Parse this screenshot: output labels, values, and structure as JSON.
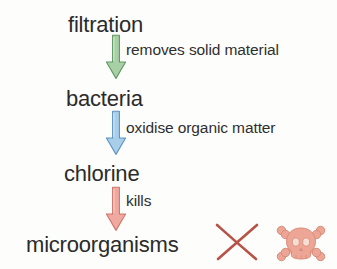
{
  "diagram": {
    "background_color": "#fdfdfc",
    "text_color": "#2b2b2b",
    "nodes": [
      {
        "id": "filtration",
        "label": "filtration"
      },
      {
        "id": "bacteria",
        "label": "bacteria"
      },
      {
        "id": "chlorine",
        "label": "chlorine"
      },
      {
        "id": "microorganisms",
        "label": "microorganisms"
      }
    ],
    "arrows": [
      {
        "id": "arrow-green",
        "icon": "down-arrow-icon",
        "caption": "removes solid material",
        "fill_color": "#a9cfa6",
        "stroke_color": "#5f9a62",
        "from": "filtration",
        "to": "bacteria"
      },
      {
        "id": "arrow-blue",
        "icon": "down-arrow-icon",
        "caption": "oxidise organic matter",
        "fill_color": "#a9cee9",
        "stroke_color": "#5f93c4",
        "from": "bacteria",
        "to": "chlorine"
      },
      {
        "id": "arrow-red",
        "icon": "down-arrow-icon",
        "caption": "kills",
        "fill_color": "#efa9a0",
        "stroke_color": "#d2756a",
        "from": "chlorine",
        "to": "microorganisms"
      }
    ],
    "marks": [
      {
        "id": "cross",
        "icon": "cross-mark-icon",
        "label": "X",
        "color": "#b85247"
      },
      {
        "id": "skull",
        "icon": "skull-and-crossbones-icon",
        "label": "skull and crossbones",
        "color": "#e8a192"
      }
    ]
  }
}
